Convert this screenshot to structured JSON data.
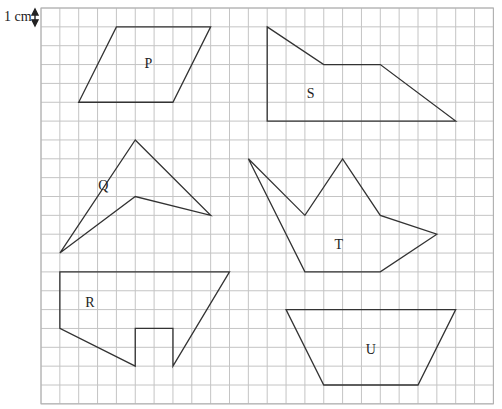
{
  "scale": {
    "label": "1 cm",
    "icon": "double-headed-vertical-arrow"
  },
  "grid": {
    "columns": 24,
    "rows": 21,
    "unit": "1 cm per square"
  },
  "shapes": [
    {
      "name": "P",
      "type": "parallelogram",
      "vertices": [
        [
          4,
          1
        ],
        [
          9,
          1
        ],
        [
          7,
          5
        ],
        [
          2,
          5
        ]
      ],
      "label_at": [
        5.7,
        3
      ]
    },
    {
      "name": "S",
      "type": "pentagon",
      "vertices": [
        [
          12,
          1
        ],
        [
          15,
          3
        ],
        [
          18,
          3
        ],
        [
          22,
          6
        ],
        [
          12,
          6
        ]
      ],
      "label_at": [
        14.3,
        4.6
      ]
    },
    {
      "name": "Q",
      "type": "arrowhead",
      "vertices": [
        [
          5,
          7
        ],
        [
          9,
          11
        ],
        [
          5,
          10
        ],
        [
          1,
          13
        ]
      ],
      "label_at": [
        3.3,
        9.5
      ]
    },
    {
      "name": "T",
      "type": "heptagon",
      "vertices": [
        [
          11,
          8
        ],
        [
          14,
          11
        ],
        [
          16,
          8
        ],
        [
          18,
          11
        ],
        [
          21,
          12
        ],
        [
          18,
          14
        ],
        [
          14,
          14
        ]
      ],
      "label_at": [
        15.8,
        12.6
      ]
    },
    {
      "name": "R",
      "type": "irregular polygon",
      "vertices": [
        [
          1,
          14
        ],
        [
          10,
          14
        ],
        [
          7,
          19
        ],
        [
          7,
          17
        ],
        [
          5,
          17
        ],
        [
          5,
          19
        ],
        [
          1,
          17
        ]
      ],
      "label_at": [
        2.6,
        15.7
      ]
    },
    {
      "name": "U",
      "type": "trapezium",
      "vertices": [
        [
          13,
          16
        ],
        [
          22,
          16
        ],
        [
          20,
          20
        ],
        [
          15,
          20
        ]
      ],
      "label_at": [
        17.5,
        18.2
      ]
    }
  ]
}
